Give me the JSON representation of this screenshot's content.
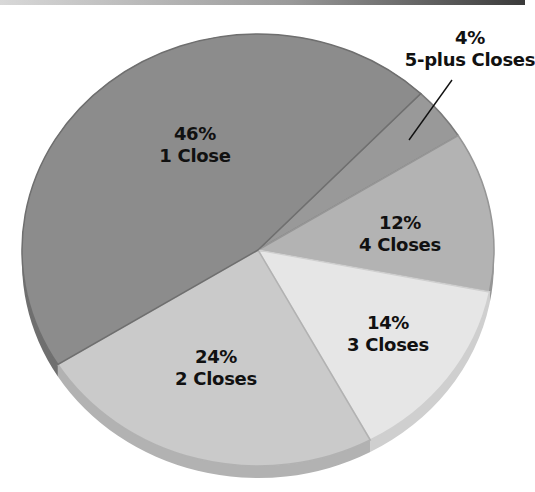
{
  "chart_data": {
    "type": "pie",
    "title": "",
    "style": "3d-tilted",
    "slices": [
      {
        "label": "1 Close",
        "value": 46,
        "pct_text": "46%",
        "color": "#8c8c8c",
        "rim": "#6f6f6f"
      },
      {
        "label": "5-plus Closes",
        "value": 4,
        "pct_text": "4%",
        "color": "#999999",
        "rim": "#7b7b7b"
      },
      {
        "label": "4 Closes",
        "value": 12,
        "pct_text": "12%",
        "color": "#b3b3b3",
        "rim": "#969696"
      },
      {
        "label": "3 Closes",
        "value": 14,
        "pct_text": "14%",
        "color": "#e6e6e6",
        "rim": "#cfcfcf"
      },
      {
        "label": "2 Closes",
        "value": 24,
        "pct_text": "24%",
        "color": "#cacaca",
        "rim": "#b2b2b2"
      }
    ],
    "categories": [
      "1 Close",
      "5-plus Closes",
      "4 Closes",
      "3 Closes",
      "2 Closes"
    ],
    "values": [
      46,
      4,
      12,
      14,
      24
    ],
    "legend": "none",
    "annotations": [
      {
        "slice": "5-plus Closes",
        "type": "leader-line",
        "text": "4% 5-plus Closes"
      }
    ]
  },
  "labels": {
    "one_close": {
      "pct": "46%",
      "name": "1 Close"
    },
    "five_plus": {
      "pct": "4%",
      "name": "5-plus Closes"
    },
    "four": {
      "pct": "12%",
      "name": "4 Closes"
    },
    "three": {
      "pct": "14%",
      "name": "3 Closes"
    },
    "two": {
      "pct": "24%",
      "name": "2 Closes"
    }
  }
}
